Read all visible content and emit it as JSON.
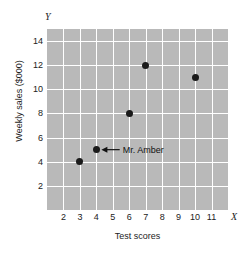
{
  "chart_data": {
    "type": "scatter",
    "title": "",
    "xlabel": "Test scores",
    "ylabel": "Weekly sales ($000)",
    "x_axis_symbol": "X",
    "y_axis_symbol": "Y",
    "xlim": [
      1,
      12
    ],
    "ylim": [
      0,
      15
    ],
    "xticks": [
      2,
      3,
      4,
      5,
      6,
      7,
      8,
      9,
      10,
      11
    ],
    "yticks": [
      2,
      4,
      6,
      8,
      10,
      12,
      14
    ],
    "xtick_labels": [
      "2",
      "3",
      "4",
      "5",
      "6",
      "7",
      "8",
      "9",
      "10",
      "11"
    ],
    "ytick_labels": [
      "2",
      "4",
      "6",
      "8",
      "10",
      "12",
      "14"
    ],
    "grid": true,
    "grid_color": "#ffffff",
    "plot_background": "#b9b9b9",
    "point_color": "#1a1a1a",
    "legend": null,
    "points": [
      {
        "x": 3,
        "y": 4
      },
      {
        "x": 4,
        "y": 5
      },
      {
        "x": 6,
        "y": 8
      },
      {
        "x": 7,
        "y": 12
      },
      {
        "x": 10,
        "y": 11
      }
    ],
    "annotations": [
      {
        "text": "Mr. Amber",
        "points_to": {
          "x": 4,
          "y": 5
        },
        "label_at": {
          "x": 5.6,
          "y": 5
        },
        "arrow": true
      }
    ]
  }
}
